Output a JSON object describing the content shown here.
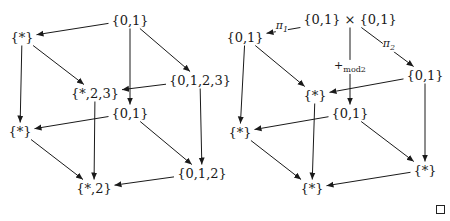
{
  "diagram": {
    "left_cube": {
      "nodes": [
        {
          "id": "L_top",
          "label": "{0,1}",
          "x": 130,
          "y": 20
        },
        {
          "id": "L_star_top",
          "label": "{*}",
          "x": 22,
          "y": 37
        },
        {
          "id": "L_0123",
          "label": "{0,1,2,3}",
          "x": 200,
          "y": 80
        },
        {
          "id": "L_star23",
          "label": "{*,2,3}",
          "x": 95,
          "y": 93
        },
        {
          "id": "L_mid01",
          "label": "{0,1}",
          "x": 130,
          "y": 113
        },
        {
          "id": "L_star_bot",
          "label": "{*}",
          "x": 20,
          "y": 131
        },
        {
          "id": "L_012",
          "label": "{0,1,2}",
          "x": 202,
          "y": 173
        },
        {
          "id": "L_star2",
          "label": "{*,2}",
          "x": 94,
          "y": 188
        }
      ],
      "edges": [
        {
          "from": "L_top",
          "to": "L_star_top"
        },
        {
          "from": "L_top",
          "to": "L_0123"
        },
        {
          "from": "L_top",
          "to": "L_mid01"
        },
        {
          "from": "L_star_top",
          "to": "L_star23"
        },
        {
          "from": "L_star_top",
          "to": "L_star_bot"
        },
        {
          "from": "L_0123",
          "to": "L_star23"
        },
        {
          "from": "L_0123",
          "to": "L_012"
        },
        {
          "from": "L_star23",
          "to": "L_star2"
        },
        {
          "from": "L_mid01",
          "to": "L_star_bot"
        },
        {
          "from": "L_mid01",
          "to": "L_012"
        },
        {
          "from": "L_star_bot",
          "to": "L_star2"
        },
        {
          "from": "L_012",
          "to": "L_star2"
        }
      ]
    },
    "right_cube": {
      "nodes": [
        {
          "id": "R_top",
          "label": "{0,1} × {0,1}",
          "x": 350,
          "y": 19
        },
        {
          "id": "R_left01",
          "label": "{0,1}",
          "x": 245,
          "y": 37
        },
        {
          "id": "R_right01",
          "label": "{0,1}",
          "x": 425,
          "y": 75
        },
        {
          "id": "R_star_c",
          "label": "{*}",
          "x": 315,
          "y": 95
        },
        {
          "id": "R_mid01",
          "label": "{0,1}",
          "x": 350,
          "y": 113
        },
        {
          "id": "R_star_l",
          "label": "{*}",
          "x": 240,
          "y": 132
        },
        {
          "id": "R_star_r",
          "label": "{*}",
          "x": 425,
          "y": 170
        },
        {
          "id": "R_star_b",
          "label": "{*}",
          "x": 312,
          "y": 188
        }
      ],
      "edges": [
        {
          "from": "R_top",
          "to": "R_left01",
          "label": "π1"
        },
        {
          "from": "R_top",
          "to": "R_right01",
          "label": "π2"
        },
        {
          "from": "R_top",
          "to": "R_mid01",
          "label": "+mod2"
        },
        {
          "from": "R_left01",
          "to": "R_star_c"
        },
        {
          "from": "R_left01",
          "to": "R_star_l"
        },
        {
          "from": "R_right01",
          "to": "R_star_c"
        },
        {
          "from": "R_right01",
          "to": "R_star_r"
        },
        {
          "from": "R_star_c",
          "to": "R_star_b"
        },
        {
          "from": "R_mid01",
          "to": "R_star_l"
        },
        {
          "from": "R_mid01",
          "to": "R_star_r"
        },
        {
          "from": "R_star_l",
          "to": "R_star_b"
        },
        {
          "from": "R_star_r",
          "to": "R_star_b"
        }
      ],
      "edge_labels": {
        "pi1": {
          "base": "π",
          "sub": "1",
          "x": 282,
          "y": 27
        },
        "pi2": {
          "base": "π",
          "sub": "2",
          "x": 389,
          "y": 45
        },
        "mod2": {
          "base": "+",
          "sub": "mod2",
          "x": 350,
          "y": 67
        }
      }
    },
    "end_marker": "□"
  }
}
